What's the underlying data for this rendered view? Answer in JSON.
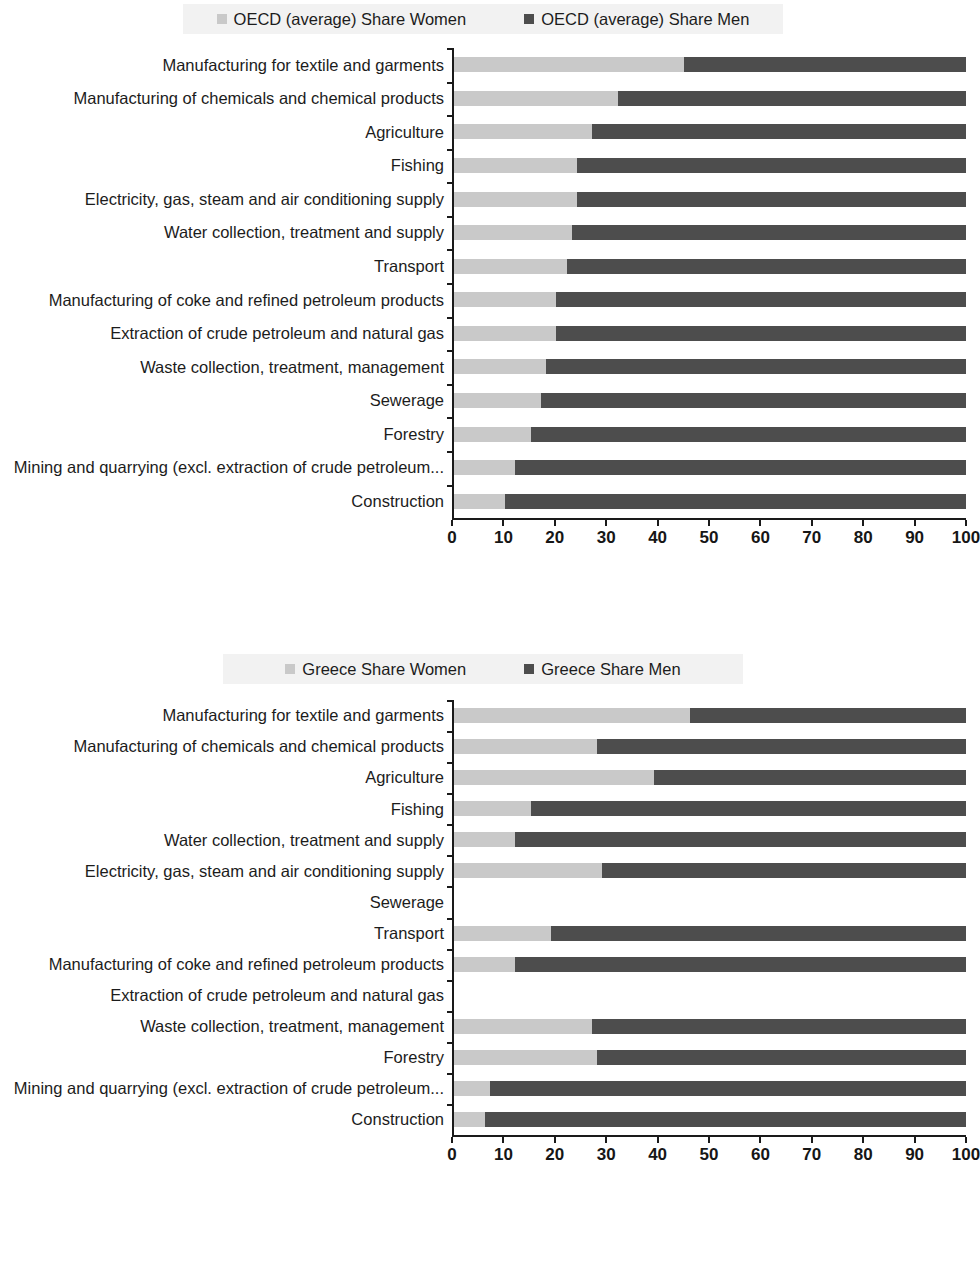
{
  "charts": [
    {
      "id": "oecd-average",
      "legend": {
        "women_label": "OECD (average) Share Women",
        "men_label": "OECD (average) Share Men",
        "women_color": "#c9c9c9",
        "men_color": "#4d4d4d"
      },
      "axis": {
        "ticks": [
          "0",
          "10",
          "20",
          "30",
          "40",
          "50",
          "60",
          "70",
          "80",
          "90",
          "100"
        ],
        "min": 0,
        "max": 100
      },
      "chart_data": {
        "type": "bar",
        "orientation": "horizontal",
        "stacked": true,
        "title": "",
        "xlabel": "",
        "ylabel": "",
        "xlim": [
          0,
          100
        ],
        "grid": false,
        "legend_position": "top",
        "categories": [
          "Manufacturing for textile and garments",
          "Manufacturing of chemicals and chemical products",
          "Agriculture",
          "Fishing",
          "Electricity, gas, steam and air conditioning supply",
          "Water collection, treatment and supply",
          "Transport",
          "Manufacturing of coke and refined petroleum products",
          "Extraction of crude petroleum and natural gas",
          "Waste collection, treatment, management",
          "Sewerage",
          "Forestry",
          "Mining and quarrying (excl. extraction of crude petroleum...",
          "Construction"
        ],
        "series": [
          {
            "name": "OECD (average) Share Women",
            "values": [
              45,
              32,
              27,
              24,
              24,
              23,
              22,
              20,
              20,
              18,
              17,
              15,
              12,
              10
            ]
          },
          {
            "name": "OECD (average) Share Men",
            "values": [
              55,
              68,
              73,
              76,
              76,
              77,
              78,
              80,
              80,
              82,
              83,
              85,
              88,
              90
            ]
          }
        ]
      }
    },
    {
      "id": "greece",
      "legend": {
        "women_label": "Greece Share Women",
        "men_label": "Greece Share Men",
        "women_color": "#c9c9c9",
        "men_color": "#4d4d4d"
      },
      "axis": {
        "ticks": [
          "0",
          "10",
          "20",
          "30",
          "40",
          "50",
          "60",
          "70",
          "80",
          "90",
          "100"
        ],
        "min": 0,
        "max": 100
      },
      "chart_data": {
        "type": "bar",
        "orientation": "horizontal",
        "stacked": true,
        "title": "",
        "xlabel": "",
        "ylabel": "",
        "xlim": [
          0,
          100
        ],
        "grid": false,
        "legend_position": "top",
        "categories": [
          "Manufacturing for textile and garments",
          "Manufacturing of chemicals and chemical products",
          "Agriculture",
          "Fishing",
          "Water collection, treatment and supply",
          "Electricity, gas, steam and air conditioning supply",
          "Sewerage",
          "Transport",
          "Manufacturing of coke and refined petroleum products",
          "Extraction of crude petroleum and natural gas",
          "Waste collection, treatment, management",
          "Forestry",
          "Mining and quarrying (excl. extraction of crude petroleum...",
          "Construction"
        ],
        "series": [
          {
            "name": "Greece Share Women",
            "values": [
              46,
              28,
              39,
              15,
              12,
              29,
              0,
              19,
              12,
              0,
              27,
              28,
              7,
              6
            ]
          },
          {
            "name": "Greece Share Men",
            "values": [
              54,
              72,
              61,
              85,
              88,
              71,
              0,
              81,
              88,
              0,
              73,
              72,
              93,
              94
            ]
          }
        ]
      }
    }
  ]
}
